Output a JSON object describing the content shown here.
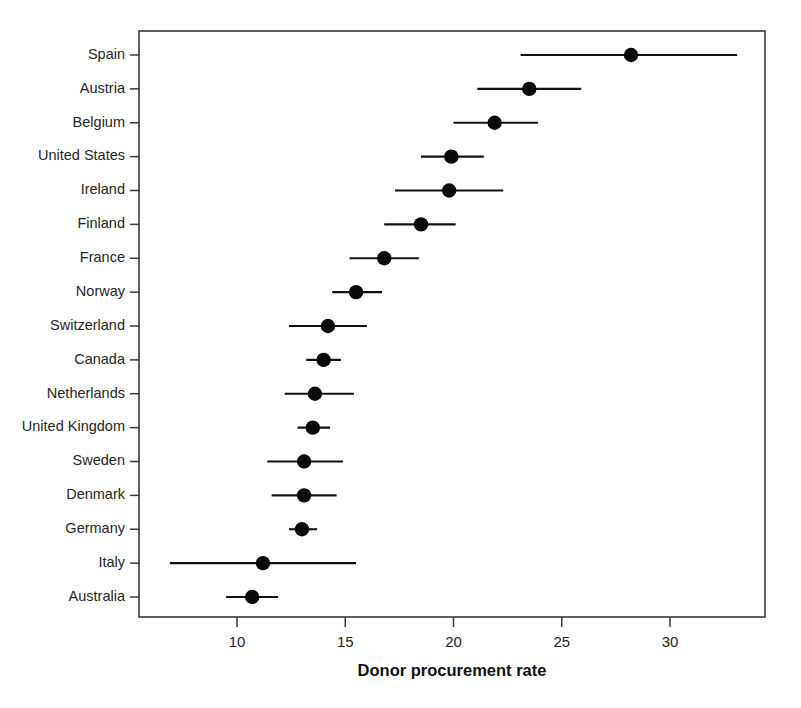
{
  "chart_data": {
    "type": "scatter",
    "title": "",
    "subtitle": "",
    "xlabel": "Donor procurement rate",
    "ylabel": "",
    "orientation": "horizontal",
    "grid": false,
    "legend": null,
    "xlim": [
      6.3,
      34.4
    ],
    "xticks": [
      10,
      15,
      20,
      25,
      30
    ],
    "xtick_labels": [
      "10",
      "15",
      "20",
      "25",
      "30"
    ],
    "categories": [
      "Spain",
      "Austria",
      "Belgium",
      "United States",
      "Ireland",
      "Finland",
      "France",
      "Norway",
      "Switzerland",
      "Canada",
      "Netherlands",
      "United Kingdom",
      "Sweden",
      "Denmark",
      "Germany",
      "Italy",
      "Australia"
    ],
    "values": [
      28.2,
      23.5,
      21.9,
      19.9,
      19.8,
      18.5,
      16.8,
      15.5,
      14.2,
      14.0,
      13.6,
      13.5,
      13.1,
      13.1,
      13.0,
      11.2,
      10.7
    ],
    "ci_low": [
      23.1,
      21.1,
      20.0,
      18.5,
      17.3,
      16.8,
      15.2,
      14.4,
      12.4,
      13.2,
      12.2,
      12.8,
      11.4,
      11.6,
      12.4,
      6.9,
      9.5
    ],
    "ci_high": [
      33.1,
      25.9,
      23.9,
      21.4,
      22.3,
      20.1,
      18.4,
      16.7,
      16.0,
      14.8,
      15.4,
      14.3,
      14.9,
      14.6,
      13.7,
      15.5,
      11.9
    ],
    "series": [
      {
        "name": "Donor procurement rate",
        "marker": "filled-circle",
        "color": "#0a0a0a",
        "error_bars": "horizontal-ci"
      }
    ]
  },
  "axis": {
    "frame_color": "#3a3a3a",
    "tick_color": "#3a3a3a",
    "point_color": "#0a0a0a",
    "line_color": "#101010"
  }
}
